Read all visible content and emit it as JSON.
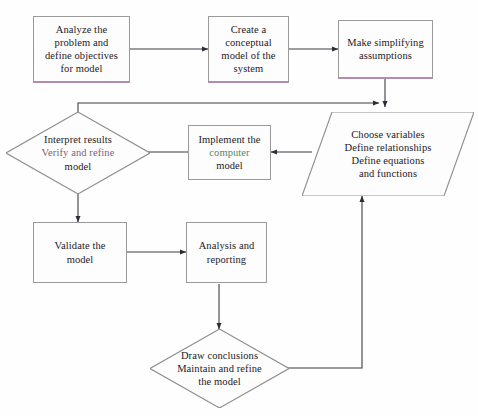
{
  "diagram": {
    "type": "flowchart",
    "background_color": "#fefefe",
    "line_color": "#3c3a42",
    "box_border_color": "#9a9a9a",
    "accent_underline_color": "#b38ab0",
    "text_color": "#24201f"
  },
  "nodes": {
    "analyze": {
      "shape": "rectangle",
      "lines": [
        "Analyze the",
        "problem and",
        "define objectives",
        "for model"
      ]
    },
    "conceptual": {
      "shape": "rectangle",
      "lines": [
        "Create a",
        "conceptual",
        "model of the",
        "system"
      ]
    },
    "assumptions": {
      "shape": "rectangle",
      "lines": [
        "Make simplifying",
        "assumptions"
      ]
    },
    "variables": {
      "shape": "parallelogram",
      "lines": [
        "Choose variables",
        "Define relationships",
        "Define equations",
        "and functions"
      ]
    },
    "implement": {
      "shape": "rectangle",
      "lines": [
        "Implement the",
        "computer",
        "model"
      ]
    },
    "interpret": {
      "shape": "diamond",
      "lines": [
        "Interpret results",
        "Verify and refine",
        "model"
      ]
    },
    "validate": {
      "shape": "rectangle",
      "lines": [
        "Validate the",
        "model"
      ]
    },
    "analysis": {
      "shape": "rectangle",
      "lines": [
        "Analysis and",
        "reporting"
      ]
    },
    "conclusions": {
      "shape": "diamond",
      "lines": [
        "Draw conclusions",
        "Maintain and refine",
        "the model"
      ]
    }
  },
  "edges": [
    {
      "from": "analyze",
      "to": "conceptual",
      "direction": "right"
    },
    {
      "from": "conceptual",
      "to": "assumptions",
      "direction": "right"
    },
    {
      "from": "assumptions",
      "to": "variables",
      "direction": "down"
    },
    {
      "from": "interpret",
      "to": "variables",
      "direction": "up-right"
    },
    {
      "from": "variables",
      "to": "implement",
      "direction": "left"
    },
    {
      "from": "implement",
      "to": "interpret",
      "direction": "left"
    },
    {
      "from": "interpret",
      "to": "validate",
      "direction": "down"
    },
    {
      "from": "validate",
      "to": "analysis",
      "direction": "right"
    },
    {
      "from": "analysis",
      "to": "conclusions",
      "direction": "down"
    },
    {
      "from": "conclusions",
      "to": "variables",
      "direction": "right-up"
    }
  ]
}
